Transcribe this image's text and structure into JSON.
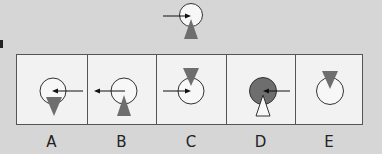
{
  "puzzle": {
    "type": "visual-analogy-odd-rotation",
    "colors": {
      "background": "#d6d6d6",
      "panel_bg": "#f2f2f2",
      "triangle_fill": "#6e6e6e",
      "circle_outline": "#333333",
      "filled_circle": "#6e6e6e"
    },
    "question_figure": {
      "circle": "white",
      "arrow": "from-left-pointing-right-into-center",
      "triangle": "gray-pointing-up-below-circle"
    },
    "options": [
      {
        "label": "A",
        "circle": "white",
        "arrow": "from-right-pointing-left",
        "triangle": "gray-pointing-down-below"
      },
      {
        "label": "B",
        "circle": "white",
        "arrow": "from-center-pointing-left-outward",
        "triangle": "gray-pointing-up-below"
      },
      {
        "label": "C",
        "circle": "white",
        "arrow": "from-left-pointing-right",
        "triangle": "gray-pointing-down-above"
      },
      {
        "label": "D",
        "circle": "gray",
        "arrow": "from-right-pointing-left",
        "triangle": "white-pointing-up-below"
      },
      {
        "label": "E",
        "circle": "white",
        "arrow": "none",
        "triangle": "gray-pointing-down-above"
      }
    ]
  }
}
